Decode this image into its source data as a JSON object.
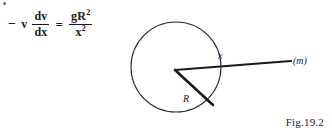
{
  "page": {
    "background_color": "#ffffff",
    "ink_color": "#1a1a1a",
    "width": 332,
    "height": 138
  },
  "equation": {
    "full_text": "− v dv/dx = gR²/x²",
    "minus_sign": "−",
    "variable_v": "v",
    "left_fraction": {
      "numerator": "dv",
      "denominator": "dx"
    },
    "equals_sign": "=",
    "right_fraction": {
      "numerator_base": "gR",
      "numerator_exponent": "2",
      "denominator_base": "x",
      "denominator_exponent": "2"
    }
  },
  "diagram": {
    "type": "geometry-sketch",
    "circle": {
      "center_x": 176,
      "center_y": 67,
      "radius": 45,
      "stroke_color": "#2b2b2b",
      "stroke_width": 1
    },
    "vertex": {
      "x": 175,
      "y": 70
    },
    "radius_line": {
      "label": "R",
      "label_x": 186,
      "label_y": 100,
      "end_x": 213,
      "end_y": 105,
      "stroke_width": 2.6
    },
    "distance_line": {
      "label": "x",
      "label_x": 219,
      "label_y": 58,
      "end_x": 291,
      "end_y": 61,
      "stroke_width": 2.2
    },
    "mass_label": {
      "text": "(m)",
      "x": 294,
      "y": 64
    }
  },
  "caption": {
    "text": "Fig.19.2"
  },
  "artifacts": {
    "top_left_speck": "scan-speck"
  }
}
